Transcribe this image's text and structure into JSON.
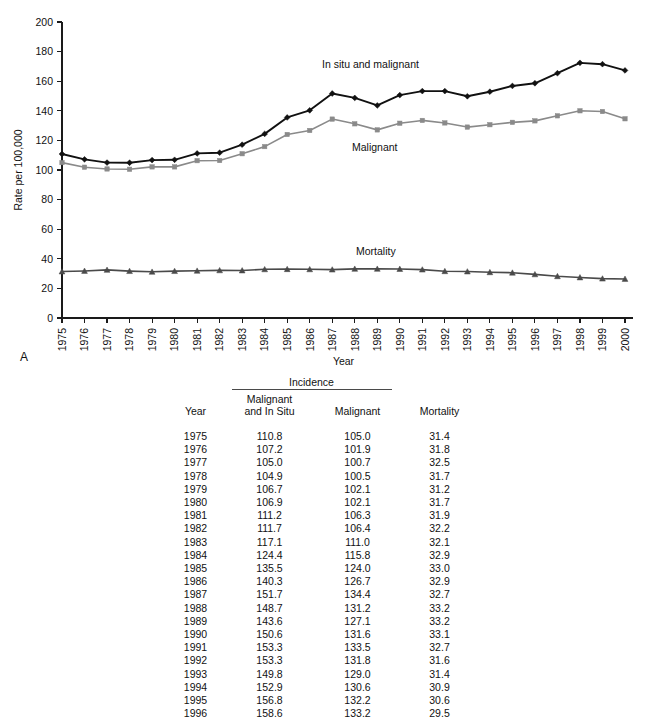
{
  "figure": {
    "panel_letter": "A",
    "ylabel": "Rate per 100,000",
    "xlabel": "Year",
    "series_labels": {
      "in_situ_and_malignant": "In situ and malignant",
      "malignant": "Malignant",
      "mortality": "Mortality"
    },
    "colors": {
      "in_situ_and_malignant": "#111111",
      "malignant": "#8a8a8a",
      "mortality": "#4a4a4a",
      "axis": "#1a1a1a",
      "background": "#ffffff"
    }
  },
  "chart_data": {
    "type": "line",
    "title": "",
    "xlabel": "Year",
    "ylabel": "Rate per 100,000",
    "xlim": [
      1975,
      2000
    ],
    "ylim": [
      0,
      200
    ],
    "yticks": [
      0,
      20,
      40,
      60,
      80,
      100,
      120,
      140,
      160,
      180,
      200
    ],
    "ytick_labels": [
      "0",
      "20",
      "40",
      "60",
      "80",
      "100",
      "120",
      "140",
      "160",
      "180",
      "200"
    ],
    "grid": false,
    "legend_position": "inline-annotations",
    "x": [
      1975,
      1976,
      1977,
      1978,
      1979,
      1980,
      1981,
      1982,
      1983,
      1984,
      1985,
      1986,
      1987,
      1988,
      1989,
      1990,
      1991,
      1992,
      1993,
      1994,
      1995,
      1996,
      1997,
      1998,
      1999,
      2000
    ],
    "xtick_labels": [
      "1975",
      "1976",
      "1977",
      "1978",
      "1979",
      "1980",
      "1981",
      "1982",
      "1983",
      "1984",
      "1985",
      "1986",
      "1987",
      "1988",
      "1989",
      "1990",
      "1991",
      "1992",
      "1993",
      "1994",
      "1995",
      "1996",
      "1997",
      "1998",
      "1999",
      "2000"
    ],
    "series": [
      {
        "name": "In situ and malignant",
        "color": "#111111",
        "marker": "diamond",
        "values": [
          110.8,
          107.2,
          105.0,
          104.9,
          106.7,
          106.9,
          111.2,
          111.7,
          117.1,
          124.4,
          135.5,
          140.3,
          151.7,
          148.7,
          143.6,
          150.6,
          153.3,
          153.3,
          149.8,
          152.9,
          156.8,
          158.6,
          165.4,
          172.4,
          171.5,
          167.3
        ]
      },
      {
        "name": "Malignant",
        "color": "#8a8a8a",
        "marker": "square",
        "values": [
          105.0,
          101.9,
          100.7,
          100.5,
          102.1,
          102.1,
          106.3,
          106.4,
          111.0,
          115.8,
          124.0,
          126.7,
          134.4,
          131.2,
          127.1,
          131.6,
          133.5,
          131.8,
          129.0,
          130.6,
          132.2,
          133.2,
          136.6,
          140.0,
          139.5,
          134.6
        ]
      },
      {
        "name": "Mortality",
        "color": "#4a4a4a",
        "marker": "triangle",
        "values": [
          31.4,
          31.8,
          32.5,
          31.7,
          31.2,
          31.7,
          31.9,
          32.2,
          32.1,
          32.9,
          33.0,
          32.9,
          32.7,
          33.2,
          33.2,
          33.1,
          32.7,
          31.6,
          31.4,
          30.9,
          30.6,
          29.5,
          28.2,
          27.4,
          26.6,
          26.4
        ]
      }
    ]
  },
  "table": {
    "group_header": "Incidence",
    "columns": [
      {
        "key": "year",
        "label": "Year",
        "label_line2": ""
      },
      {
        "key": "malignant_and_in_situ",
        "label": "Malignant",
        "label_line2": "and In Situ"
      },
      {
        "key": "malignant",
        "label": "Malignant",
        "label_line2": ""
      },
      {
        "key": "mortality",
        "label": "Mortality",
        "label_line2": ""
      }
    ],
    "rows": [
      {
        "year": "1975",
        "malignant_and_in_situ": "110.8",
        "malignant": "105.0",
        "mortality": "31.4"
      },
      {
        "year": "1976",
        "malignant_and_in_situ": "107.2",
        "malignant": "101.9",
        "mortality": "31.8"
      },
      {
        "year": "1977",
        "malignant_and_in_situ": "105.0",
        "malignant": "100.7",
        "mortality": "32.5"
      },
      {
        "year": "1978",
        "malignant_and_in_situ": "104.9",
        "malignant": "100.5",
        "mortality": "31.7"
      },
      {
        "year": "1979",
        "malignant_and_in_situ": "106.7",
        "malignant": "102.1",
        "mortality": "31.2"
      },
      {
        "year": "1980",
        "malignant_and_in_situ": "106.9",
        "malignant": "102.1",
        "mortality": "31.7"
      },
      {
        "year": "1981",
        "malignant_and_in_situ": "111.2",
        "malignant": "106.3",
        "mortality": "31.9"
      },
      {
        "year": "1982",
        "malignant_and_in_situ": "111.7",
        "malignant": "106.4",
        "mortality": "32.2"
      },
      {
        "year": "1983",
        "malignant_and_in_situ": "117.1",
        "malignant": "111.0",
        "mortality": "32.1"
      },
      {
        "year": "1984",
        "malignant_and_in_situ": "124.4",
        "malignant": "115.8",
        "mortality": "32.9"
      },
      {
        "year": "1985",
        "malignant_and_in_situ": "135.5",
        "malignant": "124.0",
        "mortality": "33.0"
      },
      {
        "year": "1986",
        "malignant_and_in_situ": "140.3",
        "malignant": "126.7",
        "mortality": "32.9"
      },
      {
        "year": "1987",
        "malignant_and_in_situ": "151.7",
        "malignant": "134.4",
        "mortality": "32.7"
      },
      {
        "year": "1988",
        "malignant_and_in_situ": "148.7",
        "malignant": "131.2",
        "mortality": "33.2"
      },
      {
        "year": "1989",
        "malignant_and_in_situ": "143.6",
        "malignant": "127.1",
        "mortality": "33.2"
      },
      {
        "year": "1990",
        "malignant_and_in_situ": "150.6",
        "malignant": "131.6",
        "mortality": "33.1"
      },
      {
        "year": "1991",
        "malignant_and_in_situ": "153.3",
        "malignant": "133.5",
        "mortality": "32.7"
      },
      {
        "year": "1992",
        "malignant_and_in_situ": "153.3",
        "malignant": "131.8",
        "mortality": "31.6"
      },
      {
        "year": "1993",
        "malignant_and_in_situ": "149.8",
        "malignant": "129.0",
        "mortality": "31.4"
      },
      {
        "year": "1994",
        "malignant_and_in_situ": "152.9",
        "malignant": "130.6",
        "mortality": "30.9"
      },
      {
        "year": "1995",
        "malignant_and_in_situ": "156.8",
        "malignant": "132.2",
        "mortality": "30.6"
      },
      {
        "year": "1996",
        "malignant_and_in_situ": "158.6",
        "malignant": "133.2",
        "mortality": "29.5"
      }
    ]
  }
}
